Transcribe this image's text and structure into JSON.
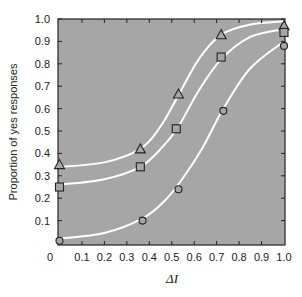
{
  "chart_data": {
    "type": "line",
    "title": "",
    "xlabel": "ΔI",
    "ylabel": "Proportion of yes responses",
    "xlim": [
      0,
      1.0
    ],
    "ylim": [
      0,
      1.0
    ],
    "x_ticks": [
      "0",
      "0.1",
      "0.2",
      "0.3",
      "0.4",
      "0.5",
      "0.6",
      "0.7",
      "0.8",
      "0.9",
      "1.0"
    ],
    "y_ticks": [
      "0.1",
      "0.2",
      "0.3",
      "0.4",
      "0.5",
      "0.6",
      "0.7",
      "0.8",
      "0.9",
      "1.0"
    ],
    "grid": false,
    "legend": "none",
    "background": "#a6a6a6",
    "curve_color": "#ffffff",
    "series": [
      {
        "name": "triangle",
        "marker": "triangle",
        "x": [
          0.0,
          0.36,
          0.53,
          0.72,
          1.0
        ],
        "values": [
          0.35,
          0.42,
          0.665,
          0.93,
          0.97
        ]
      },
      {
        "name": "square",
        "marker": "square",
        "x": [
          0.0,
          0.36,
          0.52,
          0.72,
          1.0
        ],
        "values": [
          0.25,
          0.34,
          0.51,
          0.83,
          0.94
        ]
      },
      {
        "name": "circle",
        "marker": "circle",
        "x": [
          0.0,
          0.37,
          0.53,
          0.73,
          1.0
        ],
        "values": [
          0.01,
          0.1,
          0.24,
          0.59,
          0.88
        ]
      }
    ]
  }
}
